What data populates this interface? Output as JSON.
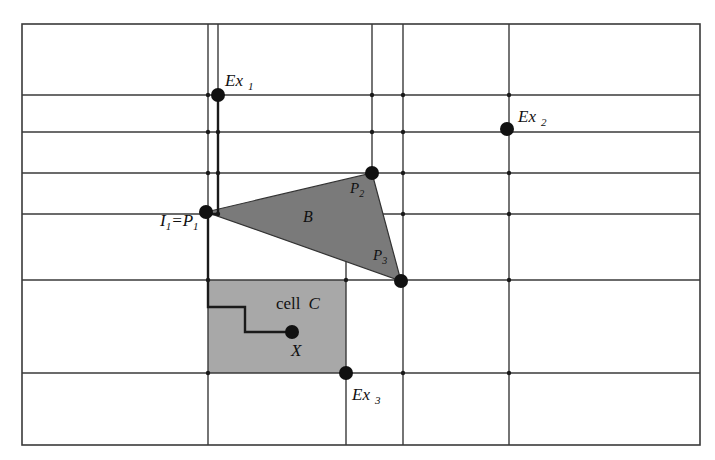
{
  "diagram": {
    "width": 715,
    "height": 460,
    "background": "#ffffff",
    "border": {
      "x1": 22,
      "y1": 24,
      "x2": 700,
      "y2": 445
    },
    "horizontal_lines": [
      {
        "y": 95,
        "x1": 22,
        "x2": 700
      },
      {
        "y": 132,
        "x1": 22,
        "x2": 700
      },
      {
        "y": 173,
        "x1": 22,
        "x2": 700
      },
      {
        "y": 214,
        "x1": 22,
        "x2": 700
      },
      {
        "y": 280,
        "x1": 22,
        "x2": 700
      },
      {
        "y": 373,
        "x1": 22,
        "x2": 700
      }
    ],
    "vertical_lines": [
      {
        "x": 208,
        "y1": 24,
        "y2": 445
      },
      {
        "x": 218,
        "y1": 24,
        "y2": 214
      },
      {
        "x": 346,
        "y1": 258,
        "y2": 445
      },
      {
        "x": 372,
        "y1": 24,
        "y2": 173
      },
      {
        "x": 403,
        "y1": 24,
        "y2": 445
      },
      {
        "x": 509,
        "y1": 24,
        "y2": 445
      }
    ],
    "cell_c": {
      "x": 208,
      "y": 280,
      "width": 138,
      "height": 93,
      "fill": "#a8a8a8"
    },
    "triangle_b": {
      "points": [
        [
          206,
          212
        ],
        [
          372,
          173
        ],
        [
          401,
          281
        ]
      ],
      "fill": "#7a7a7a",
      "stroke": "#333333"
    },
    "paths": [
      {
        "name": "ex1-to-p1",
        "points": [
          [
            218,
            95
          ],
          [
            218,
            214
          ],
          [
            208,
            214
          ]
        ]
      },
      {
        "name": "p1-to-x",
        "points": [
          [
            208,
            214
          ],
          [
            208,
            307
          ],
          [
            245,
            307
          ],
          [
            245,
            332
          ],
          [
            292,
            332
          ]
        ]
      }
    ],
    "points": [
      {
        "id": "Ex1",
        "x": 218,
        "y": 95,
        "r": 7
      },
      {
        "id": "Ex2",
        "x": 507,
        "y": 129,
        "r": 7
      },
      {
        "id": "P1",
        "x": 206,
        "y": 212,
        "r": 7
      },
      {
        "id": "P2",
        "x": 372,
        "y": 173,
        "r": 7
      },
      {
        "id": "P3",
        "x": 401,
        "y": 281,
        "r": 7
      },
      {
        "id": "X",
        "x": 292,
        "y": 332,
        "r": 7
      },
      {
        "id": "Ex3",
        "x": 346,
        "y": 373,
        "r": 7
      }
    ],
    "junction_color": "#1a1a1a",
    "labels": {
      "ex1": {
        "main": "Ex",
        "sub": "1",
        "x": 225,
        "y": 86
      },
      "ex2": {
        "main": "Ex",
        "sub": "2",
        "x": 518,
        "y": 122
      },
      "ex3": {
        "main": "Ex",
        "sub": "3",
        "x": 352,
        "y": 400
      },
      "i1p1": {
        "main": "I",
        "sub1": "1",
        "eq": "=P",
        "sub2": "1",
        "x": 160,
        "y": 226
      },
      "p2": {
        "main": "P",
        "sub": "2",
        "x": 350,
        "y": 193
      },
      "p3": {
        "main": "P",
        "sub": "3",
        "x": 373,
        "y": 260
      },
      "b": {
        "text": "B",
        "x": 303,
        "y": 222
      },
      "cell": {
        "word": "cell",
        "letter": "C",
        "x": 276,
        "y": 309
      },
      "x": {
        "text": "X",
        "x": 291,
        "y": 356
      }
    }
  }
}
